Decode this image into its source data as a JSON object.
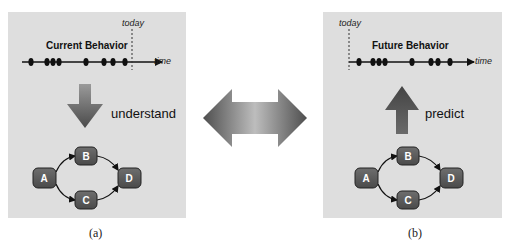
{
  "panels": {
    "a": {
      "title": "Current Behavior",
      "today_label": "today",
      "time_label": "time",
      "arrow_label": "understand",
      "arrow_direction": "down",
      "caption": "(a)",
      "nodes": [
        "A",
        "B",
        "C",
        "D"
      ]
    },
    "b": {
      "title": "Future Behavior",
      "today_label": "today",
      "time_label": "time",
      "arrow_label": "predict",
      "arrow_direction": "up",
      "caption": "(b)",
      "nodes": [
        "A",
        "B",
        "C",
        "D"
      ]
    }
  },
  "center": {
    "connector": "double-headed-arrow"
  },
  "colors": {
    "panel_bg": "#dedede",
    "node_fill": "#5a5a5a",
    "arrow_dark": "#555555",
    "arrow_light": "#b5b5b5"
  }
}
